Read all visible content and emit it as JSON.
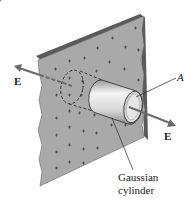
{
  "diagram": {
    "labels": {
      "field_left": "E",
      "field_right": "E",
      "area": "A",
      "cylinder_line1": "Gaussian",
      "cylinder_line2": "cylinder"
    },
    "charge_symbol": "+",
    "colors": {
      "sheet_face": "#a9a9a9",
      "sheet_edge": "#5a5a5a",
      "arrow": "#6b6b6b",
      "cylinder_light": "#f2f2f2",
      "cylinder_dark": "#9a9a9a",
      "text": "#1a1a1a"
    }
  }
}
